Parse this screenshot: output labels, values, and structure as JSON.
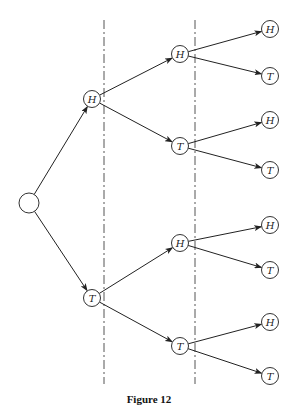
{
  "caption": "Figure 12",
  "tree": {
    "root": {
      "id": "root",
      "label": ""
    },
    "level1": [
      {
        "id": "h",
        "label": "H",
        "parent": "root"
      },
      {
        "id": "t",
        "label": "T",
        "parent": "root"
      }
    ],
    "level2": [
      {
        "id": "hh",
        "label": "H",
        "parent": "h"
      },
      {
        "id": "ht",
        "label": "T",
        "parent": "h"
      },
      {
        "id": "th",
        "label": "H",
        "parent": "t"
      },
      {
        "id": "tt",
        "label": "T",
        "parent": "t"
      }
    ],
    "level3": [
      {
        "id": "hhh",
        "label": "H",
        "parent": "hh"
      },
      {
        "id": "hht",
        "label": "T",
        "parent": "hh"
      },
      {
        "id": "hth",
        "label": "H",
        "parent": "ht"
      },
      {
        "id": "htt",
        "label": "T",
        "parent": "ht"
      },
      {
        "id": "thh",
        "label": "H",
        "parent": "th"
      },
      {
        "id": "tht",
        "label": "T",
        "parent": "th"
      },
      {
        "id": "tth",
        "label": "H",
        "parent": "tt"
      },
      {
        "id": "ttt",
        "label": "T",
        "parent": "tt"
      }
    ]
  }
}
